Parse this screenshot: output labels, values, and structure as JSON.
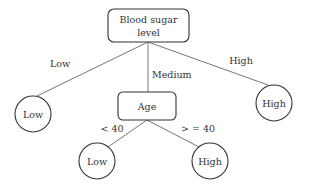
{
  "diagram": {
    "type": "decision-tree",
    "root": {
      "label_line1": "Blood sugar",
      "label_line2": "level"
    },
    "edges": {
      "root_low": "Low",
      "root_medium": "Medium",
      "root_high": "High",
      "age_lt40": "< 40",
      "age_ge40": "> = 40"
    },
    "leaves": {
      "root_low": "Low",
      "root_high": "High",
      "age_low": "Low",
      "age_high": "High"
    },
    "age_node": {
      "label": "Age"
    }
  }
}
